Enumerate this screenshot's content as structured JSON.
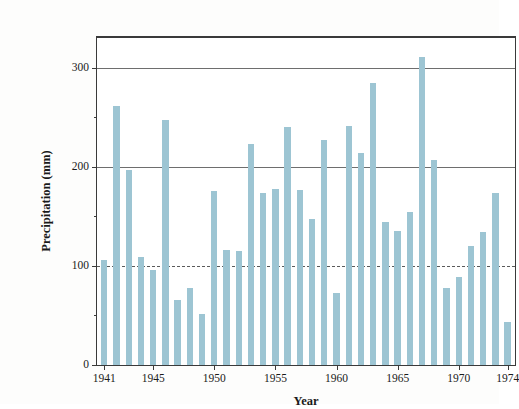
{
  "chart_data": {
    "type": "bar",
    "title": "",
    "xlabel": "Year",
    "ylabel": "Precipitation (mm)",
    "xlim": [
      1940.4,
      1974.6
    ],
    "ylim": [
      0,
      330
    ],
    "yticks": [
      0,
      100,
      200,
      300
    ],
    "ytick_labels": [
      "0",
      "100",
      "200",
      "300"
    ],
    "yticks_minor": [
      50,
      150,
      250
    ],
    "xticks": [
      1941,
      1945,
      1950,
      1955,
      1960,
      1965,
      1970,
      1974
    ],
    "xtick_labels": [
      "1941",
      "1945",
      "1950",
      "1955",
      "1960",
      "1965",
      "1970",
      "1974"
    ],
    "gridlines": [
      100,
      200,
      300
    ],
    "grid": true,
    "legend": null,
    "bar_color": "#9dc5d3",
    "axis_color": "#3a3a3a",
    "categories": [
      "1941",
      "1942",
      "1943",
      "1944",
      "1945",
      "1946",
      "1947",
      "1948",
      "1949",
      "1950",
      "1951",
      "1952",
      "1953",
      "1954",
      "1955",
      "1956",
      "1957",
      "1958",
      "1959",
      "1960",
      "1961",
      "1962",
      "1963",
      "1964",
      "1965",
      "1966",
      "1967",
      "1968",
      "1969",
      "1970",
      "1971",
      "1972",
      "1973",
      "1974"
    ],
    "values": [
      106,
      261,
      197,
      109,
      96,
      247,
      66,
      78,
      51,
      176,
      116,
      115,
      223,
      174,
      178,
      240,
      177,
      147,
      227,
      73,
      241,
      214,
      285,
      144,
      135,
      154,
      311,
      207,
      78,
      89,
      120,
      134,
      174,
      43
    ]
  }
}
